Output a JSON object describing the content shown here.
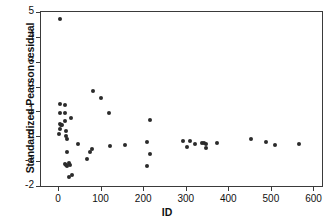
{
  "chart_data": {
    "type": "scatter",
    "title": "",
    "xlabel": "ID",
    "ylabel": "Standardized Pearson residual",
    "xlim": [
      -40,
      620
    ],
    "ylim": [
      -2,
      5
    ],
    "xticks": [
      0,
      100,
      200,
      300,
      400,
      500,
      600
    ],
    "xtick_labels": [
      "0",
      "100",
      "200",
      "300",
      "400",
      "500",
      "600"
    ],
    "yticks": [
      -2,
      -1,
      0,
      1,
      2,
      3,
      4,
      5
    ],
    "ytick_labels": [
      "-2",
      "-1",
      "0",
      "1",
      "2",
      "3",
      "4",
      "5"
    ],
    "grid": false,
    "legend": null,
    "marker": "filled-circle",
    "marker_color": "#2b2b2b",
    "points": [
      {
        "x": 5,
        "y": 4.7
      },
      {
        "x": 4,
        "y": 1.3
      },
      {
        "x": 16,
        "y": 1.25
      },
      {
        "x": 4,
        "y": 0.92
      },
      {
        "x": 17,
        "y": 0.92
      },
      {
        "x": 30,
        "y": 0.75
      },
      {
        "x": 17,
        "y": 0.6
      },
      {
        "x": 4,
        "y": 0.48
      },
      {
        "x": 7,
        "y": 0.45
      },
      {
        "x": 10,
        "y": 0.44
      },
      {
        "x": 4,
        "y": 0.3
      },
      {
        "x": 18,
        "y": 0.22
      },
      {
        "x": 3,
        "y": 0.08
      },
      {
        "x": 18,
        "y": 0.02
      },
      {
        "x": 20,
        "y": -0.1
      },
      {
        "x": 46,
        "y": -0.3
      },
      {
        "x": 22,
        "y": -0.62
      },
      {
        "x": 68,
        "y": -0.9
      },
      {
        "x": 76,
        "y": -0.62
      },
      {
        "x": 80,
        "y": -0.52
      },
      {
        "x": 16,
        "y": -1.12
      },
      {
        "x": 19,
        "y": -1.14
      },
      {
        "x": 22,
        "y": -1.18
      },
      {
        "x": 25,
        "y": -1.06
      },
      {
        "x": 28,
        "y": -1.14
      },
      {
        "x": 26,
        "y": -1.62
      },
      {
        "x": 32,
        "y": -1.55
      },
      {
        "x": 82,
        "y": 1.84
      },
      {
        "x": 101,
        "y": 1.56
      },
      {
        "x": 120,
        "y": 0.94
      },
      {
        "x": 121,
        "y": -0.38
      },
      {
        "x": 158,
        "y": -0.36
      },
      {
        "x": 209,
        "y": -0.22
      },
      {
        "x": 216,
        "y": 0.64
      },
      {
        "x": 217,
        "y": -0.7
      },
      {
        "x": 209,
        "y": -1.18
      },
      {
        "x": 293,
        "y": -0.18
      },
      {
        "x": 302,
        "y": -0.44
      },
      {
        "x": 310,
        "y": -0.18
      },
      {
        "x": 322,
        "y": -0.3
      },
      {
        "x": 337,
        "y": -0.28
      },
      {
        "x": 344,
        "y": -0.28
      },
      {
        "x": 347,
        "y": -0.3
      },
      {
        "x": 348,
        "y": -0.46
      },
      {
        "x": 373,
        "y": -0.28
      },
      {
        "x": 454,
        "y": -0.11
      },
      {
        "x": 489,
        "y": -0.22
      },
      {
        "x": 510,
        "y": -0.36
      },
      {
        "x": 565,
        "y": -0.3
      }
    ]
  }
}
